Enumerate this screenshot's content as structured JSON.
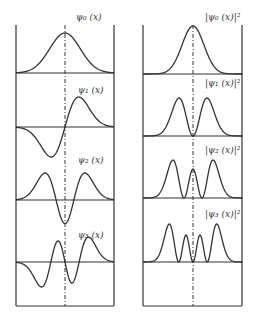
{
  "figure": {
    "width": 254,
    "height": 323,
    "line_color": "#333333",
    "background": "#ffffff"
  },
  "panels": [
    {
      "id": "wavefunctions",
      "frame": {
        "x1": 16,
        "x2": 114,
        "y1": 25,
        "y2": 306
      },
      "center_x": 65,
      "plots": [
        {
          "n": 0,
          "label": "ψ₀ (x)",
          "kind": "psi",
          "baseline": 73,
          "amp": 40,
          "label_x": 76,
          "label_y": 20
        },
        {
          "n": 1,
          "label": "ψ₁ (x)",
          "kind": "psi",
          "baseline": 127,
          "amp": 30,
          "label_x": 78,
          "label_y": 93
        },
        {
          "n": 2,
          "label": "ψ₂ (x)",
          "kind": "psi",
          "baseline": 200,
          "amp": 27,
          "label_x": 78,
          "label_y": 163
        },
        {
          "n": 3,
          "label": "ψ₃ (x)",
          "kind": "psi",
          "baseline": 262,
          "amp": 25,
          "label_x": 78,
          "label_y": 238
        }
      ]
    },
    {
      "id": "probability-densities",
      "frame": {
        "x1": 143,
        "x2": 242,
        "y1": 25,
        "y2": 306
      },
      "center_x": 193,
      "plots": [
        {
          "n": 0,
          "label": "|ψ₀ (x)|²",
          "kind": "psi2",
          "baseline": 74,
          "amp": 48,
          "label_x": 205,
          "label_y": 20
        },
        {
          "n": 1,
          "label": "|ψ₁ (x)|²",
          "kind": "psi2",
          "baseline": 136,
          "amp": 38,
          "label_x": 205,
          "label_y": 86
        },
        {
          "n": 2,
          "label": "|ψ₂ (x)|²",
          "kind": "psi2",
          "baseline": 198,
          "amp": 38,
          "label_x": 205,
          "label_y": 153
        },
        {
          "n": 3,
          "label": "|ψ₃ (x)|²",
          "kind": "psi2",
          "baseline": 262,
          "amp": 38,
          "label_x": 205,
          "label_y": 217
        }
      ]
    }
  ]
}
